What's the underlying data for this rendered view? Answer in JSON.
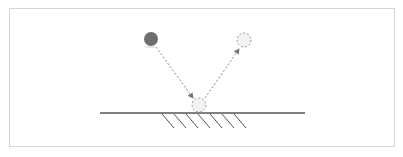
{
  "diagram": {
    "colors": {
      "frame": "#d6d6d6",
      "surface": "#555555",
      "hatch": "#555555",
      "ball_solid": "#6e6e6e",
      "ball_ghost_stroke": "#999999",
      "ball_ghost_fill": "#f2f2f2",
      "path": "#8a8a8a"
    },
    "balls": [
      {
        "id": "start",
        "style": "solid",
        "cx": 151,
        "cy": 39,
        "r": 7
      },
      {
        "id": "impact",
        "style": "dashed",
        "cx": 199,
        "cy": 105,
        "r": 7
      },
      {
        "id": "end",
        "style": "dashed",
        "cx": 244,
        "cy": 40,
        "r": 7
      }
    ],
    "paths": [
      {
        "id": "incoming",
        "from": [
          156,
          47
        ],
        "to": [
          193,
          98
        ]
      },
      {
        "id": "outgoing",
        "from": [
          205,
          98
        ],
        "to": [
          239,
          49
        ]
      }
    ],
    "surface": {
      "x1": 100,
      "x2": 305,
      "y": 113
    },
    "hatches": {
      "count": 7,
      "start_x": 162,
      "spacing": 12,
      "y_top": 114,
      "dx": 12,
      "dy": 14
    }
  }
}
